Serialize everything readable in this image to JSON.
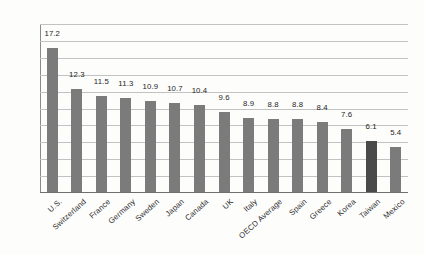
{
  "chart_data": {
    "type": "bar",
    "title": "",
    "xlabel": "",
    "ylabel": "",
    "ylim": [
      0.0,
      20.0
    ],
    "ytick_step": 2.0,
    "grid": true,
    "legend": "none",
    "orientation": "vertical",
    "categories": [
      "U.S.",
      "Switzerland",
      "France",
      "Germany",
      "Sweden",
      "Japan",
      "Canada",
      "UK",
      "Italy",
      "OECD Average",
      "Spain",
      "Greece",
      "Korea",
      "Taiwan",
      "Mexico"
    ],
    "values": [
      17.2,
      12.3,
      11.5,
      11.3,
      10.9,
      10.7,
      10.4,
      9.6,
      8.9,
      8.8,
      8.8,
      8.4,
      7.6,
      6.1,
      5.4
    ],
    "value_labels": [
      "17.2",
      "12.3",
      "11.5",
      "11.3",
      "10.9",
      "10.7",
      "10.4",
      "9.6",
      "8.9",
      "8.8",
      "8.8",
      "8.4",
      "7.6",
      "6.1",
      "5.4"
    ],
    "ytick_labels": [
      "0.0",
      "2.0",
      "4.0",
      "6.0",
      "8.0",
      "10.0",
      "12.0",
      "14.0",
      "16.0",
      "18.0",
      "20.0"
    ],
    "ytick_values": [
      0,
      2,
      4,
      6,
      8,
      10,
      12,
      14,
      16,
      18,
      20
    ],
    "highlight_category": "Taiwan",
    "colors": {
      "bar": "#7b7b7b",
      "bar_highlight": "#4a4a4a",
      "gridline": "#c2c2c2",
      "axis": "#6f6f6f",
      "text": "#2b2b2b",
      "background": "#fdfdfc"
    }
  }
}
